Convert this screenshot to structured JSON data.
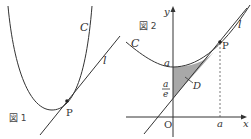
{
  "figure1": {
    "caption": "図 1",
    "curve_label": "C",
    "tangent_label": "l",
    "point_label": "P"
  },
  "figure2": {
    "caption": "図 2",
    "curve_label": "C",
    "tangent_label": "l",
    "point_label": "P",
    "region_label": "D",
    "y_axis_label": "y",
    "x_axis_label": "x",
    "origin_label": "O",
    "y_intercept_curve_label": "a",
    "y_intercept_tangent_numerator": "a",
    "y_intercept_tangent_denominator": "e",
    "x_tick_label": "a"
  },
  "colors": {
    "line": "#333333",
    "shade": "#a8a8a8"
  }
}
